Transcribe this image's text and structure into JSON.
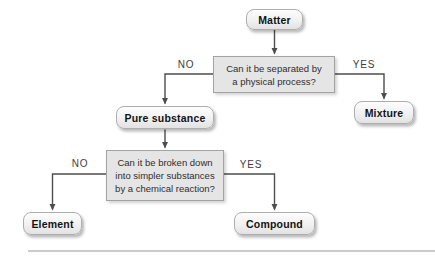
{
  "diagram": {
    "nodes": {
      "matter": {
        "label": "Matter"
      },
      "q1": {
        "lines": [
          "Can it be separated by",
          "a physical process?"
        ]
      },
      "pure_substance": {
        "label": "Pure substance"
      },
      "mixture": {
        "label": "Mixture"
      },
      "q2": {
        "lines": [
          "Can it be broken down",
          "into simpler substances",
          "by a chemical reaction?"
        ]
      },
      "element": {
        "label": "Element"
      },
      "compound": {
        "label": "Compound"
      }
    },
    "edges": [
      {
        "from": "matter",
        "to": "q1",
        "label": ""
      },
      {
        "from": "q1",
        "to": "pure_substance",
        "label": "NO"
      },
      {
        "from": "q1",
        "to": "mixture",
        "label": "YES"
      },
      {
        "from": "pure_substance",
        "to": "q2",
        "label": ""
      },
      {
        "from": "q2",
        "to": "element",
        "label": "NO"
      },
      {
        "from": "q2",
        "to": "compound",
        "label": "YES"
      }
    ],
    "colors": {
      "terminal_fill_top": "#fdfdfd",
      "terminal_fill_bottom": "#e2e2e2",
      "terminal_border": "#aeaeae",
      "decision_fill": "#e5e5e5",
      "decision_border": "#a3a3a3",
      "connector": "#4d4d4d",
      "bottom_rule": "#cbcbcb"
    }
  }
}
